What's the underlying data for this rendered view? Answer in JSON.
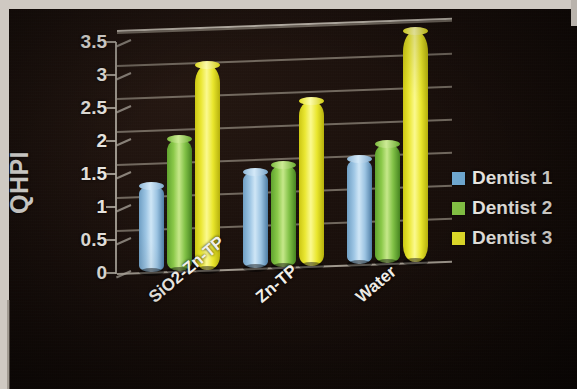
{
  "chart_data": {
    "type": "bar",
    "title": "",
    "subtitle": "",
    "xlabel": "",
    "ylabel": "QHPI",
    "categories": [
      "SiO2-Zn-TP",
      "Zn-TP",
      "Water"
    ],
    "series": [
      {
        "name": "Dentist 1",
        "color": "#9ec6e4",
        "values": [
          1.3,
          1.45,
          1.6
        ]
      },
      {
        "name": "Dentist 2",
        "color": "#8bc94a",
        "values": [
          2.0,
          1.55,
          1.8
        ]
      },
      {
        "name": "Dentist 3",
        "color": "#eae733",
        "values": [
          3.1,
          2.5,
          3.5
        ]
      }
    ],
    "ylim": [
      0,
      3.5
    ],
    "ytick_labels": [
      "3.5",
      "3",
      "2.5",
      "2",
      "1.5",
      "1",
      "0.5",
      "0"
    ],
    "ytick_values": [
      3.5,
      3,
      2.5,
      2,
      1.5,
      1,
      0.5,
      0
    ],
    "grid": true,
    "legend_position": "right",
    "style": "3d-cylinder",
    "background_color": "#140c08",
    "text_color": "#f2efe9",
    "gridline_color": "#8e867a",
    "axis_color": "#b6b0a6"
  },
  "axis": {
    "y_title": "QHPI",
    "ticks": [
      {
        "label": "3.5",
        "value": 3.5
      },
      {
        "label": "3",
        "value": 3
      },
      {
        "label": "2.5",
        "value": 2.5
      },
      {
        "label": "2",
        "value": 2
      },
      {
        "label": "1.5",
        "value": 1.5
      },
      {
        "label": "1",
        "value": 1
      },
      {
        "label": "0.5",
        "value": 0.5
      },
      {
        "label": "0",
        "value": 0
      }
    ],
    "categories": [
      {
        "label": "SiO2-Zn-TP"
      },
      {
        "label": "Zn-TP"
      },
      {
        "label": "Water"
      }
    ]
  },
  "legend": {
    "items": [
      {
        "label": "Dentist 1",
        "color": "#6fa8d0"
      },
      {
        "label": "Dentist 2",
        "color": "#83c244"
      },
      {
        "label": "Dentist 3",
        "color": "#e4e02a"
      }
    ]
  }
}
